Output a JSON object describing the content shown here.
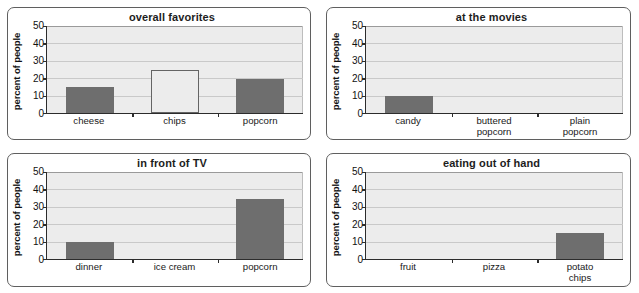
{
  "page": {
    "background_color": "#ffffff"
  },
  "style": {
    "bar_fill_color": "#6e6e6e",
    "bar_outline_color": "#646464",
    "plot_background_color": "#ececec",
    "gridline_color": "#c9c9c9",
    "axis_color": "#2c2c2c",
    "panel_border_color": "#5f5f5f"
  },
  "axis": {
    "y_title": "percent of people",
    "y_ticks": [
      0,
      10,
      20,
      30,
      40,
      50
    ],
    "y_min": 0,
    "y_max": 50
  },
  "charts": [
    {
      "id": "overall-favorites",
      "title": "overall favorites",
      "categories": [
        "cheese",
        "chips",
        "popcorn"
      ],
      "values": [
        15,
        24.5,
        19.5
      ],
      "styles": [
        "filled",
        "outline",
        "filled"
      ]
    },
    {
      "id": "at-the-movies",
      "title": "at the movies",
      "categories": [
        "candy",
        "buttered\npopcorn",
        "plain\npopcorn"
      ],
      "values": [
        10,
        0,
        0
      ],
      "styles": [
        "filled",
        "filled",
        "filled"
      ]
    },
    {
      "id": "in-front-of-tv",
      "title": "in front of TV",
      "categories": [
        "dinner",
        "ice cream",
        "popcorn"
      ],
      "values": [
        10,
        0,
        34.5
      ],
      "styles": [
        "filled",
        "filled",
        "filled"
      ]
    },
    {
      "id": "eating-out-of-hand",
      "title": "eating out of hand",
      "categories": [
        "fruit",
        "pizza",
        "potato chips"
      ],
      "values": [
        0,
        0,
        15
      ],
      "styles": [
        "filled",
        "filled",
        "filled"
      ]
    }
  ],
  "chart_data": [
    {
      "type": "bar",
      "title": "overall favorites",
      "xlabel": "",
      "ylabel": "percent of people",
      "categories": [
        "cheese",
        "chips",
        "popcorn"
      ],
      "values": [
        15,
        24.5,
        19.5
      ],
      "ylim": [
        0,
        50
      ],
      "yticks": [
        0,
        10,
        20,
        30,
        40,
        50
      ],
      "grid": "horizontal",
      "legend": "none",
      "notes": "The 'chips' bar is drawn as an unfilled outline; the others are solid gray."
    },
    {
      "type": "bar",
      "title": "at the movies",
      "xlabel": "",
      "ylabel": "percent of people",
      "categories": [
        "candy",
        "buttered popcorn",
        "plain popcorn"
      ],
      "values": [
        10,
        0,
        0
      ],
      "ylim": [
        0,
        50
      ],
      "yticks": [
        0,
        10,
        20,
        30,
        40,
        50
      ],
      "grid": "horizontal",
      "legend": "none"
    },
    {
      "type": "bar",
      "title": "in front of TV",
      "xlabel": "",
      "ylabel": "percent of people",
      "categories": [
        "dinner",
        "ice cream",
        "popcorn"
      ],
      "values": [
        10,
        0,
        34.5
      ],
      "ylim": [
        0,
        50
      ],
      "yticks": [
        0,
        10,
        20,
        30,
        40,
        50
      ],
      "grid": "horizontal",
      "legend": "none"
    },
    {
      "type": "bar",
      "title": "eating out of hand",
      "xlabel": "",
      "ylabel": "percent of people",
      "categories": [
        "fruit",
        "pizza",
        "potato chips"
      ],
      "values": [
        0,
        0,
        15
      ],
      "ylim": [
        0,
        50
      ],
      "yticks": [
        0,
        10,
        20,
        30,
        40,
        50
      ],
      "grid": "horizontal",
      "legend": "none"
    }
  ]
}
